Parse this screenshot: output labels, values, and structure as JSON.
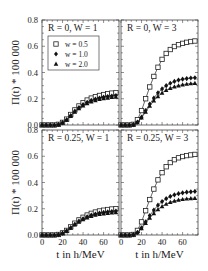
{
  "chart_data": {
    "type": "line",
    "layout": "2x2 grid, shared axes",
    "ylabel": "Π(t) * 100 000",
    "xlabel": "t in h/MeV",
    "xlim": [
      0,
      75
    ],
    "ylim": [
      0,
      0.8
    ],
    "xticks": [
      0,
      20,
      40,
      60
    ],
    "yticks": [
      0.0,
      0.2,
      0.4,
      0.6,
      0.8
    ],
    "ytick_labels": [
      "0.0",
      "0.2",
      "0.4",
      "0.6",
      "0.8"
    ],
    "xtick_labels": [
      "0",
      "20",
      "40",
      "60"
    ],
    "grid": false,
    "legend": {
      "panel": 0,
      "entries": [
        {
          "label": "w = 0.5",
          "marker": "open-square"
        },
        {
          "label": "w = 1.0",
          "marker": "filled-diamond"
        },
        {
          "label": "w = 2.0",
          "marker": "filled-triangle"
        }
      ]
    },
    "x": [
      0,
      4,
      8,
      12,
      16,
      20,
      24,
      28,
      32,
      36,
      40,
      44,
      48,
      52,
      56,
      60,
      64,
      68,
      72
    ],
    "panels": [
      {
        "title": "R = 0, W = 1",
        "series": [
          {
            "name": "w = 0.5",
            "values": [
              0,
              0,
              0,
              0,
              0.005,
              0.02,
              0.045,
              0.08,
              0.115,
              0.145,
              0.17,
              0.19,
              0.205,
              0.215,
              0.225,
              0.232,
              0.238,
              0.243,
              0.247
            ]
          },
          {
            "name": "w = 1.0",
            "values": [
              0,
              0,
              0,
              0,
              0.004,
              0.018,
              0.04,
              0.072,
              0.105,
              0.133,
              0.155,
              0.173,
              0.187,
              0.197,
              0.205,
              0.212,
              0.217,
              0.221,
              0.224
            ]
          },
          {
            "name": "w = 2.0",
            "values": [
              0,
              0,
              0,
              0,
              0.004,
              0.017,
              0.038,
              0.068,
              0.1,
              0.127,
              0.148,
              0.165,
              0.178,
              0.188,
              0.196,
              0.202,
              0.207,
              0.211,
              0.214
            ]
          }
        ]
      },
      {
        "title": "R = 0, W = 3",
        "series": [
          {
            "name": "w = 0.5",
            "values": [
              0,
              0,
              0,
              0.005,
              0.04,
              0.11,
              0.2,
              0.29,
              0.37,
              0.44,
              0.5,
              0.545,
              0.575,
              0.598,
              0.612,
              0.622,
              0.63,
              0.636,
              0.64
            ]
          },
          {
            "name": "w = 1.0",
            "values": [
              0,
              0,
              0,
              0.003,
              0.022,
              0.06,
              0.11,
              0.16,
              0.205,
              0.245,
              0.275,
              0.3,
              0.318,
              0.332,
              0.342,
              0.349,
              0.354,
              0.358,
              0.36
            ]
          },
          {
            "name": "w = 2.0",
            "values": [
              0,
              0,
              0,
              0.003,
              0.02,
              0.055,
              0.1,
              0.145,
              0.185,
              0.218,
              0.245,
              0.265,
              0.28,
              0.292,
              0.3,
              0.307,
              0.312,
              0.316,
              0.318
            ]
          }
        ]
      },
      {
        "title": "R = 0.25, W = 1",
        "series": [
          {
            "name": "w = 0.5",
            "values": [
              0,
              0,
              0,
              0,
              0.004,
              0.016,
              0.035,
              0.062,
              0.09,
              0.115,
              0.135,
              0.152,
              0.165,
              0.175,
              0.183,
              0.189,
              0.194,
              0.198,
              0.201
            ]
          },
          {
            "name": "w = 1.0",
            "values": [
              0,
              0,
              0,
              0,
              0.003,
              0.014,
              0.032,
              0.056,
              0.082,
              0.105,
              0.124,
              0.139,
              0.151,
              0.16,
              0.167,
              0.172,
              0.176,
              0.179,
              0.182
            ]
          },
          {
            "name": "w = 2.0",
            "values": [
              0,
              0,
              0,
              0,
              0.003,
              0.013,
              0.03,
              0.053,
              0.078,
              0.1,
              0.118,
              0.132,
              0.143,
              0.152,
              0.158,
              0.163,
              0.167,
              0.17,
              0.172
            ]
          }
        ]
      },
      {
        "title": "R = 0.25, W = 3",
        "series": [
          {
            "name": "w = 0.5",
            "values": [
              0,
              0,
              0,
              0.004,
              0.035,
              0.1,
              0.185,
              0.27,
              0.35,
              0.42,
              0.475,
              0.52,
              0.552,
              0.574,
              0.588,
              0.598,
              0.605,
              0.61,
              0.614
            ]
          },
          {
            "name": "w = 1.0",
            "values": [
              0,
              0,
              0,
              0.003,
              0.02,
              0.055,
              0.1,
              0.148,
              0.19,
              0.227,
              0.255,
              0.277,
              0.294,
              0.306,
              0.315,
              0.321,
              0.326,
              0.329,
              0.332
            ]
          },
          {
            "name": "w = 2.0",
            "values": [
              0,
              0,
              0,
              0.003,
              0.018,
              0.05,
              0.09,
              0.13,
              0.165,
              0.195,
              0.218,
              0.236,
              0.25,
              0.26,
              0.267,
              0.272,
              0.276,
              0.279,
              0.281
            ]
          }
        ]
      }
    ]
  }
}
